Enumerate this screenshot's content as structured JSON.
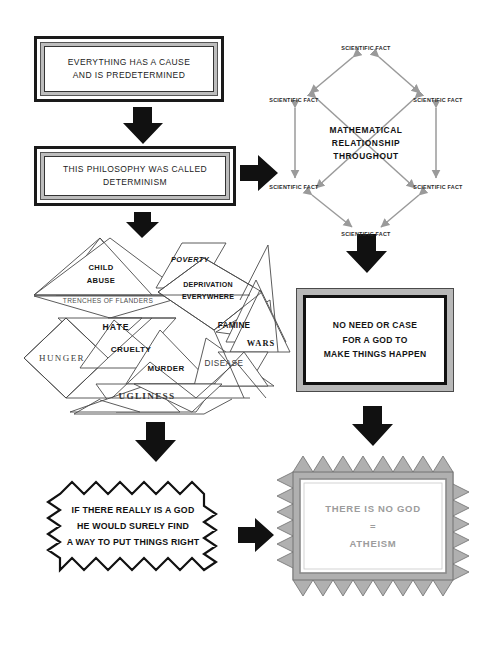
{
  "diagram": {
    "stages": [
      {
        "id": "stage-1",
        "kind": "framed-text-box",
        "text": "EVERYTHING HAS A CAUSE\nAND IS PREDETERMINED"
      },
      {
        "id": "stage-2",
        "kind": "framed-text-box",
        "text": "THIS PHILOSOPHY WAS CALLED\nDETERMINISM"
      },
      {
        "id": "stage-3",
        "kind": "hexagon-network",
        "center_text": "MATHEMATICAL\nRELATIONSHIP\nTHROUGHOUT",
        "node_label": "SCIENTIFIC FACT",
        "node_count": 6,
        "nodes": [
          {
            "label": "SCIENTIFIC FACT",
            "position": "top"
          },
          {
            "label": "SCIENTIFIC FACT",
            "position": "upper-left"
          },
          {
            "label": "SCIENTIFIC FACT",
            "position": "upper-right"
          },
          {
            "label": "SCIENTIFIC FACT",
            "position": "lower-left"
          },
          {
            "label": "SCIENTIFIC FACT",
            "position": "lower-right"
          },
          {
            "label": "SCIENTIFIC FACT",
            "position": "bottom"
          }
        ]
      },
      {
        "id": "stage-4",
        "kind": "grey-framed-box",
        "text": "NO NEED OR CASE\nFOR A GOD TO\nMAKE THINGS HAPPEN"
      },
      {
        "id": "stage-5",
        "kind": "triangle-tessellation",
        "labels": [
          {
            "text": "CHILD\nABUSE",
            "style": "bold"
          },
          {
            "text": "POVERTY",
            "style": "bold-italic"
          },
          {
            "text": "TRENCHES OF FLANDERS",
            "style": "thin"
          },
          {
            "text": "DEPRIVATION\nEVERYWHERE",
            "style": "bold"
          },
          {
            "text": "HATE",
            "style": "bold"
          },
          {
            "text": "FAMINE",
            "style": "bold"
          },
          {
            "text": "WARS",
            "style": "serif-bold"
          },
          {
            "text": "HUNGER",
            "style": "serif"
          },
          {
            "text": "CRUELTY",
            "style": "bold"
          },
          {
            "text": "MURDER",
            "style": "bold"
          },
          {
            "text": "DISEASE",
            "style": "thin"
          },
          {
            "text": "UGLINESS",
            "style": "serif-bold"
          }
        ]
      },
      {
        "id": "stage-6",
        "kind": "zigzag-explosion-box",
        "text": "IF THERE REALLY IS A GOD\nHE WOULD SURELY FIND\nA WAY TO PUT THINGS RIGHT"
      },
      {
        "id": "stage-7",
        "kind": "grey-starburst-box",
        "text": "THERE IS NO GOD\n=\nATHEISM"
      }
    ],
    "connectors": [
      {
        "id": "arrow-1",
        "icon": "arrow-down-icon",
        "direction": "down",
        "from": "stage-1",
        "to": "stage-2"
      },
      {
        "id": "arrow-2",
        "icon": "arrow-right-icon",
        "direction": "right",
        "from": "stage-2",
        "to": "stage-3"
      },
      {
        "id": "arrow-3",
        "icon": "arrow-down-icon",
        "direction": "down",
        "from": "stage-3",
        "to": "stage-4"
      },
      {
        "id": "arrow-4",
        "icon": "arrow-down-icon",
        "direction": "down",
        "from": "stage-2",
        "to": "stage-5"
      },
      {
        "id": "arrow-5",
        "icon": "arrow-down-icon",
        "direction": "down",
        "from": "stage-5",
        "to": "stage-6"
      },
      {
        "id": "arrow-6",
        "icon": "arrow-down-icon",
        "direction": "down",
        "from": "stage-4",
        "to": "stage-7"
      },
      {
        "id": "arrow-7",
        "icon": "arrow-right-icon",
        "direction": "right",
        "from": "stage-6",
        "to": "stage-7"
      }
    ],
    "colors": {
      "background": "#ffffff",
      "ink": "#111111",
      "grey_fill": "#b8b8b8",
      "grey_text": "#9c9c9c",
      "hex_arrow": "#9a9a9a",
      "texture_border": "#bdbdbd"
    }
  }
}
